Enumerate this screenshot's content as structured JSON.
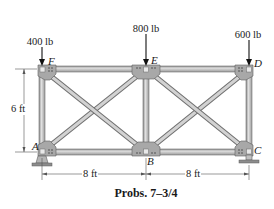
{
  "figure": {
    "caption": "Probs. 7–3/4",
    "loads": [
      {
        "joint": "F",
        "label": "400 lb"
      },
      {
        "joint": "E",
        "label": "800 lb"
      },
      {
        "joint": "D",
        "label": "600 lb"
      }
    ],
    "joints": {
      "A": "A",
      "B": "B",
      "C": "C",
      "D": "D",
      "E": "E",
      "F": "F"
    },
    "dimensions": {
      "height": "6 ft",
      "span_left": "8 ft",
      "span_right": "8 ft"
    },
    "members": [
      "FE",
      "ED",
      "AB",
      "BC",
      "AF",
      "BE",
      "CD",
      "AE",
      "FB",
      "BD",
      "EC"
    ],
    "supports": [
      {
        "joint": "A",
        "type": "pin"
      },
      {
        "joint": "C",
        "type": "roller"
      }
    ],
    "colors": {
      "member_fill": "#c8c8c8",
      "member_edge": "#6e6e6e",
      "gusset": "#9a9a9a",
      "text": "#1a1a1a",
      "dimension_line": "#555555"
    }
  }
}
